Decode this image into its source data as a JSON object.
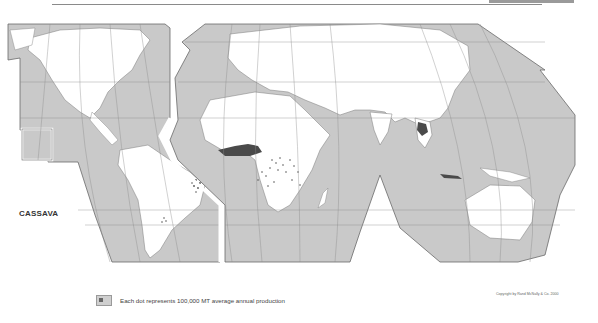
{
  "map": {
    "title": "CASSAVA",
    "projection": "interrupted world map",
    "colors": {
      "ocean": "#c9c9c9",
      "land": "#ffffff",
      "border": "#6a6a6a",
      "production_dense": "#4a4a4a",
      "production_dots": "#555555"
    },
    "production_regions": [
      {
        "name": "Nigeria / West Africa",
        "density": "dense"
      },
      {
        "name": "Congo Basin / Central Africa",
        "density": "dotted"
      },
      {
        "name": "East Africa",
        "density": "dotted"
      },
      {
        "name": "Brazil (northeast)",
        "density": "dotted"
      },
      {
        "name": "Thailand",
        "density": "dense"
      },
      {
        "name": "Indonesia (Java)",
        "density": "dense"
      }
    ]
  },
  "legend": {
    "text": "Each dot represents 100,000 MT average annual production"
  },
  "copyright": {
    "text": "Copyright by Rand McNally & Co. 2000"
  }
}
